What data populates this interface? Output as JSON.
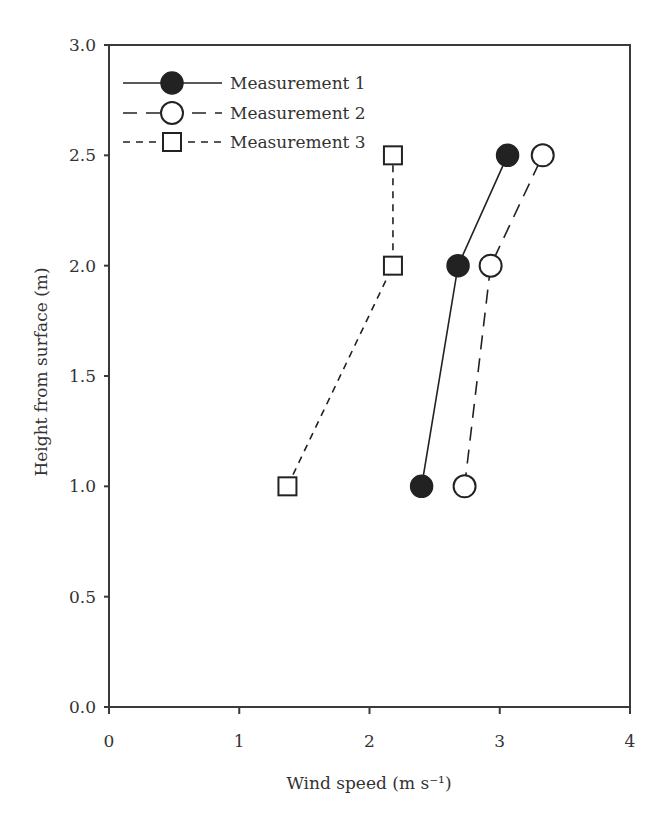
{
  "chart_data": {
    "type": "line",
    "title": "",
    "xlabel": "Wind speed (m s⁻¹)",
    "ylabel": "Height from surface (m)",
    "xlim": [
      0,
      4
    ],
    "ylim": [
      0.0,
      3.0
    ],
    "xticks": [
      "0",
      "1",
      "2",
      "3",
      "4"
    ],
    "yticks": [
      "0.0",
      "0.5",
      "1.0",
      "1.5",
      "2.0",
      "2.5",
      "3.0"
    ],
    "grid": false,
    "legend_position": "upper left",
    "series": [
      {
        "name": "Measurement 1",
        "marker": "filled-circle",
        "line_style": "solid",
        "points": [
          {
            "x": 2.4,
            "y": 1.0
          },
          {
            "x": 2.68,
            "y": 2.0
          },
          {
            "x": 3.06,
            "y": 2.5
          }
        ]
      },
      {
        "name": "Measurement 2",
        "marker": "open-circle",
        "line_style": "long-dash",
        "points": [
          {
            "x": 2.73,
            "y": 1.0
          },
          {
            "x": 2.93,
            "y": 2.0
          },
          {
            "x": 3.33,
            "y": 2.5
          }
        ]
      },
      {
        "name": "Measurement 3",
        "marker": "open-square",
        "line_style": "short-dash",
        "points": [
          {
            "x": 1.37,
            "y": 1.0
          },
          {
            "x": 2.18,
            "y": 2.0
          },
          {
            "x": 2.18,
            "y": 2.5
          }
        ]
      }
    ]
  },
  "colors": {
    "axis": "#3a3a3a",
    "series": "#222222",
    "text": "#333333"
  }
}
